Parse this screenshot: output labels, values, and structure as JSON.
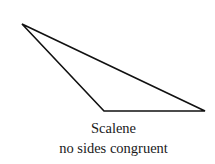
{
  "figure": {
    "shape": "triangle",
    "vertices": [
      [
        22,
        24
      ],
      [
        104,
        111
      ],
      [
        205,
        111
      ]
    ],
    "stroke_color": "#111111",
    "fill_color": "#ffffff"
  },
  "caption": {
    "title": "Scalene",
    "subtitle": "no sides congruent"
  }
}
